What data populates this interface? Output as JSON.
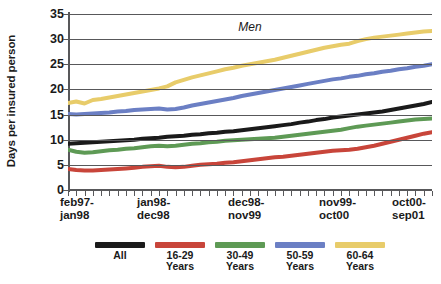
{
  "axes": {
    "ylabel": "Days per insured person",
    "yticks": [
      "35",
      "30",
      "25",
      "20",
      "15",
      "10",
      "5",
      "0"
    ],
    "xticklabels": [
      {
        "line1": "feb97-",
        "line2": "jan98"
      },
      {
        "line1": "jan98-",
        "line2": "dec98"
      },
      {
        "line1": "dec98-",
        "line2": "nov99"
      },
      {
        "line1": "nov99-",
        "line2": "oct00"
      },
      {
        "line1": "oct00-",
        "line2": "sep01"
      }
    ]
  },
  "panel": {
    "label": "Men"
  },
  "legend": {
    "items": [
      {
        "label1": "All",
        "label2": "",
        "color": "#1a1a1a"
      },
      {
        "label1": "16-29",
        "label2": "Years",
        "color": "#C8453A"
      },
      {
        "label1": "30-49",
        "label2": "Years",
        "color": "#5E9A55"
      },
      {
        "label1": "50-59",
        "label2": "Years",
        "color": "#6B7FC4"
      },
      {
        "label1": "60-64",
        "label2": "Years",
        "color": "#E8CC6A"
      }
    ]
  },
  "chart_data": {
    "type": "line",
    "title": "Men",
    "xlabel": "",
    "ylabel": "Days per insured person",
    "ylim": [
      0,
      35
    ],
    "ytick_step": 5,
    "grid": true,
    "legend_position": "bottom",
    "x": [
      "feb97-jan98",
      "mar97-feb98",
      "apr97-mar98",
      "may97-apr98",
      "jun97-may98",
      "jul97-jun98",
      "aug97-jul98",
      "sep97-aug98",
      "oct97-sep98",
      "nov97-oct98",
      "dec97-nov98",
      "jan98-dec98",
      "feb98-jan99",
      "mar98-feb99",
      "apr98-mar99",
      "may98-apr99",
      "jun98-may99",
      "jul98-jun99",
      "aug98-jul99",
      "sep98-aug99",
      "oct98-sep99",
      "nov98-oct99",
      "dec98-nov99",
      "jan99-dec99",
      "feb99-jan00",
      "mar99-feb00",
      "apr99-mar00",
      "may99-apr00",
      "jun99-may00",
      "jul99-jun00",
      "aug99-jul00",
      "sep99-aug00",
      "oct99-sep00",
      "nov99-oct00",
      "dec99-nov00",
      "jan00-dec00",
      "feb00-jan01",
      "mar00-feb01",
      "apr00-mar01",
      "may00-apr01",
      "jun00-may01",
      "jul00-jun01",
      "aug00-jul01",
      "sep00-aug01",
      "oct00-sep01"
    ],
    "x_tick_label_indices": [
      0,
      11,
      22,
      33,
      44
    ],
    "series": [
      {
        "name": "All",
        "color": "#1a1a1a",
        "values": [
          9.2,
          9.3,
          9.4,
          9.5,
          9.6,
          9.7,
          9.8,
          9.9,
          10.0,
          10.2,
          10.3,
          10.4,
          10.6,
          10.7,
          10.8,
          11.0,
          11.1,
          11.3,
          11.4,
          11.6,
          11.7,
          11.9,
          12.1,
          12.3,
          12.5,
          12.7,
          12.9,
          13.1,
          13.4,
          13.6,
          13.9,
          14.1,
          14.4,
          14.6,
          14.8,
          15.0,
          15.2,
          15.4,
          15.6,
          15.9,
          16.2,
          16.5,
          16.8,
          17.1,
          17.5
        ]
      },
      {
        "name": "16-29 Years",
        "color": "#C8453A",
        "values": [
          4.2,
          4.0,
          3.9,
          3.9,
          4.0,
          4.1,
          4.2,
          4.3,
          4.4,
          4.6,
          4.7,
          4.8,
          4.6,
          4.5,
          4.6,
          4.8,
          5.0,
          5.1,
          5.2,
          5.4,
          5.5,
          5.7,
          5.9,
          6.1,
          6.3,
          6.5,
          6.6,
          6.8,
          7.0,
          7.2,
          7.4,
          7.6,
          7.8,
          7.9,
          8.0,
          8.2,
          8.5,
          8.8,
          9.2,
          9.6,
          10.0,
          10.4,
          10.8,
          11.2,
          11.5
        ]
      },
      {
        "name": "30-49 Years",
        "color": "#5E9A55",
        "values": [
          8.0,
          7.6,
          7.4,
          7.5,
          7.7,
          7.9,
          8.0,
          8.2,
          8.3,
          8.5,
          8.7,
          8.8,
          8.7,
          8.8,
          9.0,
          9.2,
          9.3,
          9.5,
          9.6,
          9.8,
          9.9,
          10.0,
          10.1,
          10.2,
          10.3,
          10.4,
          10.6,
          10.8,
          11.0,
          11.2,
          11.4,
          11.6,
          11.8,
          12.0,
          12.3,
          12.6,
          12.8,
          13.0,
          13.2,
          13.4,
          13.6,
          13.8,
          14.0,
          14.1,
          14.2
        ]
      },
      {
        "name": "50-59 Years",
        "color": "#6B7FC4",
        "values": [
          15.1,
          15.0,
          15.1,
          15.2,
          15.3,
          15.4,
          15.6,
          15.7,
          15.9,
          16.0,
          16.1,
          16.2,
          16.0,
          16.1,
          16.4,
          16.8,
          17.1,
          17.4,
          17.7,
          18.0,
          18.3,
          18.7,
          19.0,
          19.3,
          19.6,
          19.9,
          20.2,
          20.5,
          20.8,
          21.1,
          21.4,
          21.7,
          22.0,
          22.2,
          22.5,
          22.7,
          23.0,
          23.2,
          23.5,
          23.7,
          24.0,
          24.2,
          24.5,
          24.7,
          25.0
        ]
      },
      {
        "name": "60-64 Years",
        "color": "#E8CC6A",
        "values": [
          17.3,
          17.6,
          17.2,
          17.9,
          18.1,
          18.4,
          18.7,
          19.0,
          19.3,
          19.6,
          19.9,
          20.2,
          20.6,
          21.4,
          21.9,
          22.4,
          22.8,
          23.2,
          23.6,
          24.0,
          24.3,
          24.7,
          25.0,
          25.3,
          25.6,
          25.9,
          26.3,
          26.7,
          27.1,
          27.5,
          27.9,
          28.3,
          28.6,
          28.9,
          29.1,
          29.6,
          30.0,
          30.3,
          30.5,
          30.7,
          30.9,
          31.1,
          31.3,
          31.5,
          31.6
        ]
      }
    ]
  }
}
